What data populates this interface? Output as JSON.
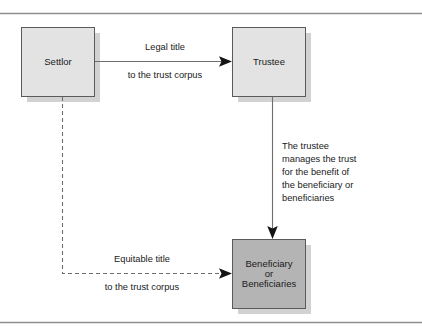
{
  "figure": {
    "type": "flow-diagram",
    "border": {
      "top_rule": "horizontal-rule",
      "bottom_rule": "horizontal-rule",
      "color": "#8d8d8d"
    },
    "colors": {
      "node_light_fill": "#e3e3e3",
      "node_dark_fill": "#b4b4b4",
      "node_stroke": "#5a5a5a",
      "shadow": "#d2d2d2",
      "connector": "#6e6e6e",
      "arrow_head": "#141414",
      "text": "#1a1a1a"
    },
    "nodes": [
      {
        "id": "settlor",
        "label": "Settlor",
        "fill": "#e3e3e3",
        "x": 21,
        "y": 27,
        "w": 73,
        "h": 69
      },
      {
        "id": "trustee",
        "label": "Trustee",
        "fill": "#e3e3e3",
        "x": 232,
        "y": 27,
        "w": 73,
        "h": 69
      },
      {
        "id": "beneficiary",
        "label_lines": [
          "Beneficiary",
          "or",
          "Beneficiaries"
        ],
        "fill": "#b4b4b4",
        "x": 232,
        "y": 239,
        "w": 73,
        "h": 69
      }
    ],
    "edges": [
      {
        "id": "settlor-to-trustee",
        "from": "settlor",
        "to": "trustee",
        "style": "solid",
        "direction": "right",
        "label_above": "Legal title",
        "label_below": "to the trust corpus"
      },
      {
        "id": "trustee-to-beneficiary",
        "from": "trustee",
        "to": "beneficiary",
        "style": "solid",
        "direction": "down",
        "label_lines": [
          "The trustee",
          "manages the trust",
          "for the benefit of",
          "the beneficiary or",
          "beneficiaries"
        ]
      },
      {
        "id": "settlor-to-beneficiary",
        "from": "settlor",
        "to": "beneficiary",
        "style": "dashed",
        "direction": "right",
        "label_above": "Equitable title",
        "label_below": "to the trust corpus"
      }
    ]
  }
}
